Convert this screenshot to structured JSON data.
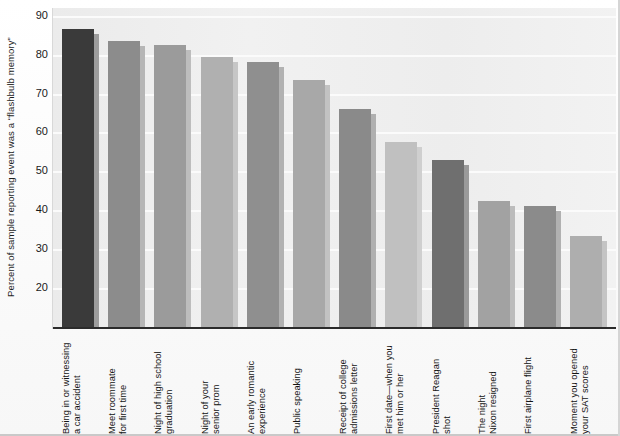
{
  "chart_data": {
    "type": "bar",
    "title": "",
    "subtitle": "",
    "xlabel": "",
    "ylabel": "Percent of sample reporting event was a “flashbulb memory”",
    "ylim": [
      10,
      92
    ],
    "yticks": [
      20,
      30,
      40,
      50,
      60,
      70,
      80,
      90
    ],
    "ytick_labels": [
      "20",
      "30",
      "40",
      "50",
      "60",
      "70",
      "80",
      "90"
    ],
    "grid": true,
    "grid_axis": "y",
    "legend": "none",
    "categories": [
      "Being in or witnessing a car accident",
      "Meet roommate for first time",
      "Night of high school graduation",
      "Night of your senior prom",
      "An early romantic experience",
      "Public speaking",
      "Receipt of college admissions letter",
      "First date—when you met him or her",
      "President Reagan shot",
      "The night Nixon resigned",
      "First airplane flight",
      "Moment you opened your SAT scores"
    ],
    "values": [
      86.5,
      83.5,
      82.5,
      79.5,
      78,
      73.5,
      66,
      57.5,
      53,
      42.5,
      41,
      33.5
    ],
    "bar_colors": [
      "#3a3a3a",
      "#8c8c8c",
      "#9b9b9b",
      "#b0b0b0",
      "#8f8f8f",
      "#a8a8a8",
      "#8a8a8a",
      "#c0c0c0",
      "#6f6f6f",
      "#a2a2a2",
      "#8b8b8b",
      "#aeaeae"
    ],
    "shadow_colors": [
      "#9d9d9d",
      "#b6b6b6",
      "#bdbdbd",
      "#c6c6c6",
      "#b2b2b2",
      "#c2c2c2",
      "#b0b0b0",
      "#cfcfcf",
      "#9a9a9a",
      "#bcbcbc",
      "#b1b1b1",
      "#c4c4c4"
    ],
    "plot_background": "#efefef",
    "gridline_color": "#fbfbfb",
    "axis_color": "#2b2b2b"
  },
  "axis": {
    "y_title": "Percent of sample reporting event was a “flashbulb memory”"
  },
  "x_labels": [
    {
      "line1": "Being in or witnessing",
      "line2": "a car accident"
    },
    {
      "line1": "Meet roommate",
      "line2": "for first time"
    },
    {
      "line1": "Night of high school",
      "line2": "graduation"
    },
    {
      "line1": "Night of your",
      "line2": "senior prom"
    },
    {
      "line1": "An early romantic",
      "line2": "experience"
    },
    {
      "line1": "Public speaking",
      "line2": ""
    },
    {
      "line1": "Receipt of college",
      "line2": "admissions letter"
    },
    {
      "line1": "First date—when you",
      "line2": "met him or her"
    },
    {
      "line1": "President Reagan",
      "line2": "shot"
    },
    {
      "line1": "The night",
      "line2": "Nixon resigned"
    },
    {
      "line1": "First airplane flight",
      "line2": ""
    },
    {
      "line1": "Moment you opened",
      "line2": "your SAT scores"
    }
  ]
}
